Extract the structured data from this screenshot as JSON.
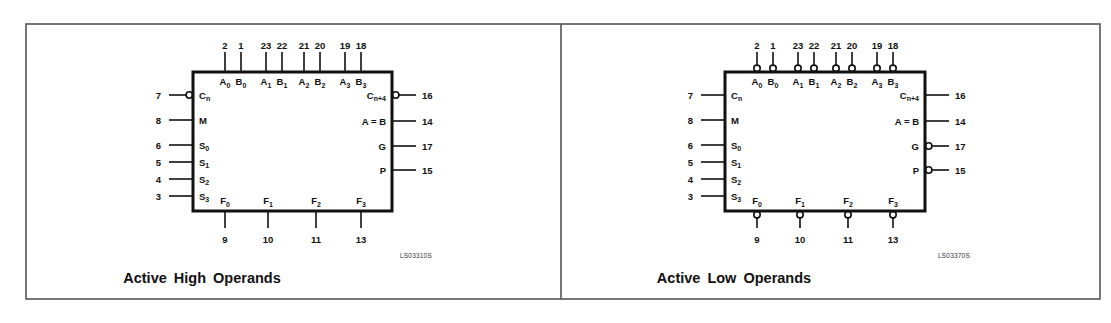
{
  "panels": [
    {
      "id": "active-high",
      "caption": "Active High Operands",
      "drawing_code": "LS03310S",
      "offset_x": 0,
      "top_pins": [
        {
          "num": "2",
          "sig": "A",
          "sub": "0",
          "x": 225,
          "inverted": false
        },
        {
          "num": "1",
          "sig": "B",
          "sub": "0",
          "x": 241,
          "inverted": false
        },
        {
          "num": "23",
          "sig": "A",
          "sub": "1",
          "x": 266,
          "inverted": false
        },
        {
          "num": "22",
          "sig": "B",
          "sub": "1",
          "x": 282,
          "inverted": false
        },
        {
          "num": "21",
          "sig": "A",
          "sub": "2",
          "x": 304,
          "inverted": false
        },
        {
          "num": "20",
          "sig": "B",
          "sub": "2",
          "x": 320,
          "inverted": false
        },
        {
          "num": "19",
          "sig": "A",
          "sub": "3",
          "x": 345,
          "inverted": false
        },
        {
          "num": "18",
          "sig": "B",
          "sub": "3",
          "x": 361,
          "inverted": false
        }
      ],
      "left_pins": [
        {
          "num": "7",
          "sig": "C",
          "sub": "n",
          "y": 95,
          "inverted": true
        },
        {
          "num": "8",
          "sig": "M",
          "sub": "",
          "y": 120,
          "inverted": false
        },
        {
          "num": "6",
          "sig": "S",
          "sub": "0",
          "y": 145,
          "inverted": false
        },
        {
          "num": "5",
          "sig": "S",
          "sub": "1",
          "y": 162,
          "inverted": false
        },
        {
          "num": "4",
          "sig": "S",
          "sub": "2",
          "y": 179,
          "inverted": false
        },
        {
          "num": "3",
          "sig": "S",
          "sub": "3",
          "y": 196,
          "inverted": false
        }
      ],
      "right_pins": [
        {
          "num": "16",
          "sig": "C",
          "sub": "n+4",
          "y": 95,
          "inverted": true
        },
        {
          "num": "14",
          "sig": "A = B",
          "sub": "",
          "y": 121,
          "inverted": false
        },
        {
          "num": "17",
          "sig": "G",
          "sub": "",
          "y": 146,
          "inverted": false
        },
        {
          "num": "15",
          "sig": "P",
          "sub": "",
          "y": 170,
          "inverted": false
        }
      ],
      "bottom_pins": [
        {
          "num": "9",
          "sig": "F",
          "sub": "0",
          "x": 225,
          "inverted": false
        },
        {
          "num": "10",
          "sig": "F",
          "sub": "1",
          "x": 268,
          "inverted": false
        },
        {
          "num": "11",
          "sig": "F",
          "sub": "2",
          "x": 316,
          "inverted": false
        },
        {
          "num": "13",
          "sig": "F",
          "sub": "3",
          "x": 361,
          "inverted": false
        }
      ]
    },
    {
      "id": "active-low",
      "caption": "Active Low Operands",
      "drawing_code": "LS03370S",
      "offset_x": 532,
      "top_pins": [
        {
          "num": "2",
          "sig": "A",
          "sub": "0",
          "x": 225,
          "inverted": true
        },
        {
          "num": "1",
          "sig": "B",
          "sub": "0",
          "x": 241,
          "inverted": true
        },
        {
          "num": "23",
          "sig": "A",
          "sub": "1",
          "x": 266,
          "inverted": true
        },
        {
          "num": "22",
          "sig": "B",
          "sub": "1",
          "x": 282,
          "inverted": true
        },
        {
          "num": "21",
          "sig": "A",
          "sub": "2",
          "x": 304,
          "inverted": true
        },
        {
          "num": "20",
          "sig": "B",
          "sub": "2",
          "x": 320,
          "inverted": true
        },
        {
          "num": "19",
          "sig": "A",
          "sub": "3",
          "x": 345,
          "inverted": true
        },
        {
          "num": "18",
          "sig": "B",
          "sub": "3",
          "x": 361,
          "inverted": true
        }
      ],
      "left_pins": [
        {
          "num": "7",
          "sig": "C",
          "sub": "n",
          "y": 95,
          "inverted": false
        },
        {
          "num": "8",
          "sig": "M",
          "sub": "",
          "y": 120,
          "inverted": false
        },
        {
          "num": "6",
          "sig": "S",
          "sub": "0",
          "y": 145,
          "inverted": false
        },
        {
          "num": "5",
          "sig": "S",
          "sub": "1",
          "y": 162,
          "inverted": false
        },
        {
          "num": "4",
          "sig": "S",
          "sub": "2",
          "y": 179,
          "inverted": false
        },
        {
          "num": "3",
          "sig": "S",
          "sub": "3",
          "y": 196,
          "inverted": false
        }
      ],
      "right_pins": [
        {
          "num": "16",
          "sig": "C",
          "sub": "n+4",
          "y": 95,
          "inverted": false
        },
        {
          "num": "14",
          "sig": "A = B",
          "sub": "",
          "y": 121,
          "inverted": false
        },
        {
          "num": "17",
          "sig": "G",
          "sub": "",
          "y": 146,
          "inverted": true
        },
        {
          "num": "15",
          "sig": "P",
          "sub": "",
          "y": 170,
          "inverted": true
        }
      ],
      "bottom_pins": [
        {
          "num": "9",
          "sig": "F",
          "sub": "0",
          "x": 225,
          "inverted": true
        },
        {
          "num": "10",
          "sig": "F",
          "sub": "1",
          "x": 268,
          "inverted": true
        },
        {
          "num": "11",
          "sig": "F",
          "sub": "2",
          "x": 316,
          "inverted": true
        },
        {
          "num": "13",
          "sig": "F",
          "sub": "3",
          "x": 361,
          "inverted": true
        }
      ]
    }
  ],
  "colors": {
    "ink": "#111111",
    "frame": "#555555",
    "background": "#ffffff"
  }
}
